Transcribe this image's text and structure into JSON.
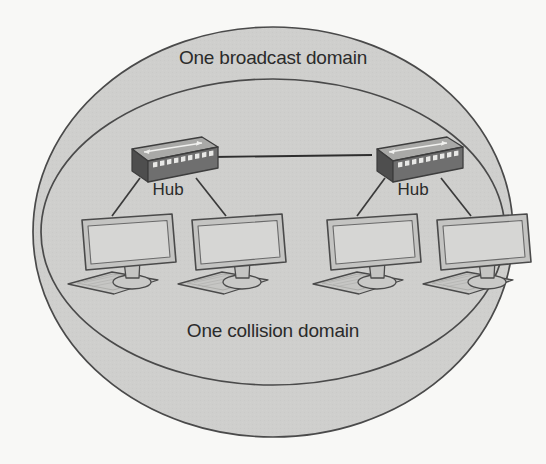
{
  "diagram": {
    "title_outer": "One broadcast domain",
    "title_inner": "One collision domain",
    "background_color": "#f8f8f6",
    "ellipse_fill": "#cfcfcd",
    "ellipse_stroke": "#4a4a4a",
    "outer_ellipse": {
      "cx": 273,
      "cy": 232,
      "rx": 240,
      "ry": 205,
      "label": "One broadcast domain"
    },
    "inner_ellipse": {
      "cx": 273,
      "cy": 232,
      "rx": 232,
      "ry": 153,
      "label": "One collision domain"
    },
    "trunk_link": {
      "label": "hub-to-hub-link",
      "color": "#2e2e2e",
      "x1": 212,
      "y1": 157,
      "x2": 372,
      "y2": 155
    },
    "hubs": [
      {
        "id": "hub-left",
        "label": "Hub",
        "x": 118,
        "y": 137,
        "label_x": 168,
        "label_y": 195,
        "ports": 10,
        "top_color": "#a9a9a7",
        "front_color": "#6f6f6f",
        "side_color": "#4e4e4e",
        "port_color": "#e8e8e6"
      },
      {
        "id": "hub-right",
        "label": "Hub",
        "x": 363,
        "y": 137,
        "label_x": 413,
        "label_y": 195,
        "ports": 10,
        "top_color": "#a9a9a7",
        "front_color": "#6f6f6f",
        "side_color": "#4e4e4e",
        "port_color": "#e8e8e6"
      }
    ],
    "computers": [
      {
        "id": "computer-1",
        "x": 66,
        "y": 212,
        "hub": "hub-left",
        "cable_from_x": 140,
        "cable_from_y": 178
      },
      {
        "id": "computer-2",
        "x": 176,
        "y": 212,
        "hub": "hub-left",
        "cable_from_x": 196,
        "cable_from_y": 178
      },
      {
        "id": "computer-3",
        "x": 311,
        "y": 212,
        "hub": "hub-right",
        "cable_from_x": 385,
        "cable_from_y": 178
      },
      {
        "id": "computer-4",
        "x": 421,
        "y": 212,
        "hub": "hub-right",
        "cable_from_x": 441,
        "cable_from_y": 178
      }
    ],
    "computer_style": {
      "screen_fill": "#d2d2d0",
      "bezel_fill": "#c4c4c2",
      "outline": "#4a4a4a",
      "stand_fill": "#c9c9c7",
      "keyboard_fill": "#c6c6c4",
      "cable_color": "#3a3a3a"
    }
  }
}
